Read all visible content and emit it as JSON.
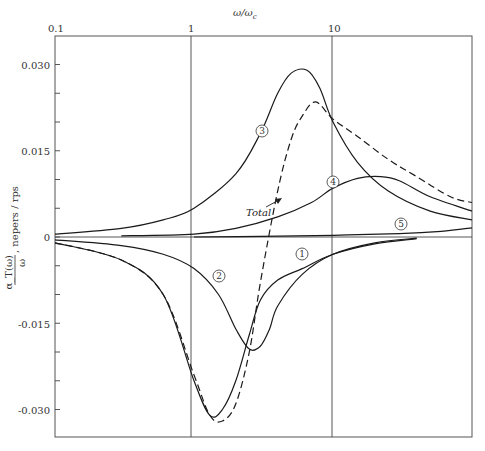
{
  "chart_data": {
    "type": "line",
    "title": "",
    "xlabel": "ω/ω_c",
    "ylabel": "α_T(ω)/ω, nepers / rps",
    "xscale": "log",
    "xlim": [
      0.1,
      100
    ],
    "ylim": [
      -0.036,
      0.035
    ],
    "x_ticks": [
      "0.1",
      "1",
      "10"
    ],
    "y_ticks": [
      "0.030",
      "0.015",
      "0",
      "-0.015",
      "-0.030"
    ],
    "y_tick_values": [
      0.03,
      0.015,
      0,
      -0.015,
      -0.03
    ],
    "grid": "vertical lines at 1 and 10; horizontal line at 0",
    "legend": "inline circled numerals on curves",
    "annotations": [
      "①",
      "②",
      "③",
      "④",
      "⑤",
      "Total"
    ],
    "series": [
      {
        "name": "1",
        "style": "solid",
        "x": [
          0.1,
          0.3,
          0.6,
          1.0,
          1.3,
          1.6,
          2.0,
          2.5,
          3.0,
          4.0,
          6.0,
          10.0,
          20.0,
          40.0
        ],
        "y": [
          -0.001,
          -0.004,
          -0.01,
          -0.025,
          -0.031,
          -0.03,
          -0.025,
          -0.017,
          -0.011,
          -0.0075,
          -0.0055,
          -0.003,
          -0.0012,
          -0.0003
        ]
      },
      {
        "name": "2",
        "style": "solid",
        "x": [
          0.1,
          0.3,
          0.6,
          1.0,
          1.5,
          2.0,
          2.5,
          3.0,
          3.5,
          4.0,
          6.0,
          10.0,
          20.0,
          40.0
        ],
        "y": [
          -0.0005,
          -0.0015,
          -0.003,
          -0.0055,
          -0.01,
          -0.016,
          -0.0195,
          -0.019,
          -0.016,
          -0.012,
          -0.0065,
          -0.003,
          -0.001,
          -0.0002
        ]
      },
      {
        "name": "3",
        "style": "solid",
        "x": [
          0.1,
          0.3,
          0.6,
          1.0,
          2.0,
          3.0,
          4.0,
          5.0,
          6.5,
          8.0,
          10.0,
          15.0,
          25.0,
          50.0,
          100.0
        ],
        "y": [
          0.0005,
          0.0015,
          0.003,
          0.005,
          0.011,
          0.018,
          0.025,
          0.0285,
          0.029,
          0.026,
          0.02,
          0.013,
          0.008,
          0.0045,
          0.003
        ]
      },
      {
        "name": "4",
        "style": "solid",
        "x": [
          0.3,
          1.0,
          2.0,
          4.0,
          7.0,
          10.0,
          15.0,
          22.0,
          30.0,
          50.0,
          100.0
        ],
        "y": [
          0.0002,
          0.0005,
          0.0015,
          0.0035,
          0.006,
          0.0085,
          0.0102,
          0.0105,
          0.0098,
          0.007,
          0.0045
        ]
      },
      {
        "name": "5",
        "style": "solid",
        "x": [
          1.0,
          3.0,
          10.0,
          30.0,
          60.0,
          100.0
        ],
        "y": [
          0.0,
          0.0001,
          0.0003,
          0.0006,
          0.001,
          0.0016
        ]
      },
      {
        "name": "Total",
        "style": "dashed",
        "x": [
          0.1,
          0.3,
          0.6,
          1.0,
          1.3,
          1.6,
          2.0,
          2.5,
          3.0,
          4.0,
          5.0,
          6.0,
          7.5,
          10.0,
          15.0,
          25.0,
          40.0,
          70.0,
          100.0
        ],
        "y": [
          -0.001,
          -0.004,
          -0.01,
          -0.024,
          -0.031,
          -0.032,
          -0.029,
          -0.02,
          -0.008,
          0.008,
          0.017,
          0.021,
          0.0235,
          0.0205,
          0.0175,
          0.0135,
          0.0105,
          0.007,
          0.006
        ]
      }
    ]
  },
  "labels": {
    "x_axis_title": "ω/ω",
    "x_axis_sub": "c",
    "y_axis_num": "α_T(ω)",
    "y_axis_den": "ω",
    "y_axis_units": ", nepers / rps",
    "total": "Total",
    "markers": [
      "1",
      "2",
      "3",
      "4",
      "5"
    ]
  }
}
